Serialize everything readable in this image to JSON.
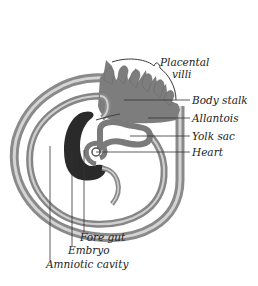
{
  "figure": {
    "colors": {
      "background": "#ffffff",
      "membrane_gray": "#7a7a7a",
      "membrane_light": "#c8c8c8",
      "embryo_dark": "#2a2a2a",
      "body_stalk": "#7f7f7f",
      "leader_line": "#333333",
      "text": "#222222"
    }
  },
  "labels": {
    "placental_villi_1": "Placental",
    "placental_villi_2": "villi",
    "body_stalk": "Body stalk",
    "allantois": "Allantois",
    "yolk_sac": "Yolk sac",
    "heart": "Heart",
    "fore_gut": "Fore gut",
    "embryo": "Embryo",
    "amniotic_cavity": "Amniotic cavity"
  }
}
